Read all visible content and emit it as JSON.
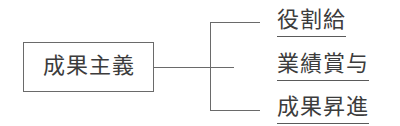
{
  "diagram": {
    "type": "tree",
    "root": {
      "label": "成果主義"
    },
    "children": [
      {
        "label": "役割給"
      },
      {
        "label": "業績賞与"
      },
      {
        "label": "成果昇進"
      }
    ],
    "colors": {
      "line": "#6a6a6a",
      "text": "#3c3c3c",
      "background": "#ffffff"
    }
  }
}
